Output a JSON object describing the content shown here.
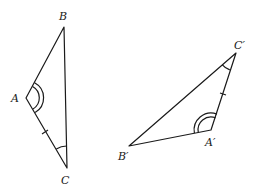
{
  "figure": {
    "stroke_color": "#1a1a1a",
    "triangle1": {
      "labels": {
        "A": "A",
        "B": "B",
        "C": "C"
      }
    },
    "triangle2": {
      "labels": {
        "A": "A′",
        "B": "B′",
        "C": "C′"
      }
    }
  }
}
